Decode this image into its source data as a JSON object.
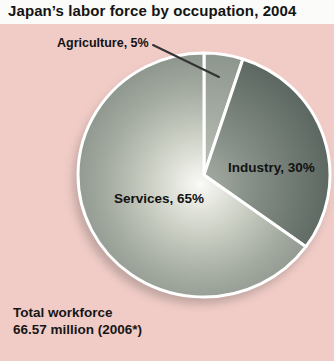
{
  "title": "Japan’s labor force by occupation, 2004",
  "footnote": {
    "line1": "Total workforce",
    "line2": "66.57 million (2006*)"
  },
  "panel": {
    "background_color": "#f1ccc7"
  },
  "chart_data": {
    "type": "pie",
    "title": "Japan’s labor force by occupation, 2004",
    "categories": [
      "Agriculture",
      "Industry",
      "Services"
    ],
    "values": [
      5,
      30,
      65
    ],
    "unit": "%",
    "start_angle_deg": 0,
    "direction": "clockwise",
    "annotation": "Total workforce 66.57 million (2006*)",
    "divider_color": "#ffffff",
    "slices": [
      {
        "name": "Agriculture",
        "label": "Agriculture, 5%",
        "value": 5,
        "label_placement": "outside-with-leader-line",
        "gradient": [
          {
            "offset": "0%",
            "color": "#c0c5ba"
          },
          {
            "offset": "100%",
            "color": "#8b948c"
          }
        ]
      },
      {
        "name": "Industry",
        "label": "Industry, 30%",
        "value": 30,
        "label_placement": "inside",
        "gradient": [
          {
            "offset": "0%",
            "color": "#a8aea4"
          },
          {
            "offset": "40%",
            "color": "#848e86"
          },
          {
            "offset": "100%",
            "color": "#5a655f"
          }
        ]
      },
      {
        "name": "Services",
        "label": "Services, 65%",
        "value": 65,
        "label_placement": "inside",
        "gradient": [
          {
            "offset": "0%",
            "color": "#fafaf6"
          },
          {
            "offset": "35%",
            "color": "#cdd1c6"
          },
          {
            "offset": "70%",
            "color": "#a3aaa0"
          },
          {
            "offset": "100%",
            "color": "#89928a"
          }
        ]
      }
    ],
    "layout": {
      "cx": 204,
      "cy": 175,
      "rx": 126,
      "ry": 122,
      "grad_cx": 200,
      "grad_cy": 184,
      "grad_r": 136,
      "stroke_width": 3,
      "shadow": {
        "cx": 200,
        "cy": 182,
        "rx": 127,
        "ry": 122,
        "color": "#8d7b77",
        "opacity": 0.5,
        "blur": 5
      },
      "leader_line": {
        "x1": 153,
        "y1": 45,
        "x2": 219,
        "y2": 77,
        "color": "#333333",
        "width": 2
      }
    },
    "legend": "none",
    "grid": false
  }
}
